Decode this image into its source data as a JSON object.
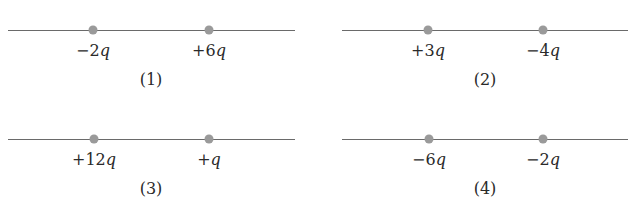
{
  "figure": {
    "panels": [
      {
        "caption": "(1)",
        "charges": [
          {
            "sign": "−",
            "magnitude": "2",
            "symbol": "q",
            "value": -2
          },
          {
            "sign": "+",
            "magnitude": "6",
            "symbol": "q",
            "value": 6
          }
        ]
      },
      {
        "caption": "(2)",
        "charges": [
          {
            "sign": "+",
            "magnitude": "3",
            "symbol": "q",
            "value": 3
          },
          {
            "sign": "−",
            "magnitude": "4",
            "symbol": "q",
            "value": -4
          }
        ]
      },
      {
        "caption": "(3)",
        "charges": [
          {
            "sign": "+",
            "magnitude": "12",
            "symbol": "q",
            "value": 12
          },
          {
            "sign": "+",
            "magnitude": "",
            "symbol": "q",
            "value": 1
          }
        ]
      },
      {
        "caption": "(4)",
        "charges": [
          {
            "sign": "−",
            "magnitude": "6",
            "symbol": "q",
            "value": -6
          },
          {
            "sign": "−",
            "magnitude": "2",
            "symbol": "q",
            "value": -2
          }
        ]
      }
    ],
    "colors": {
      "axis": "#6a6a6a",
      "charge_dot": "#9a9a9a",
      "text": "#2a2a2a"
    }
  }
}
